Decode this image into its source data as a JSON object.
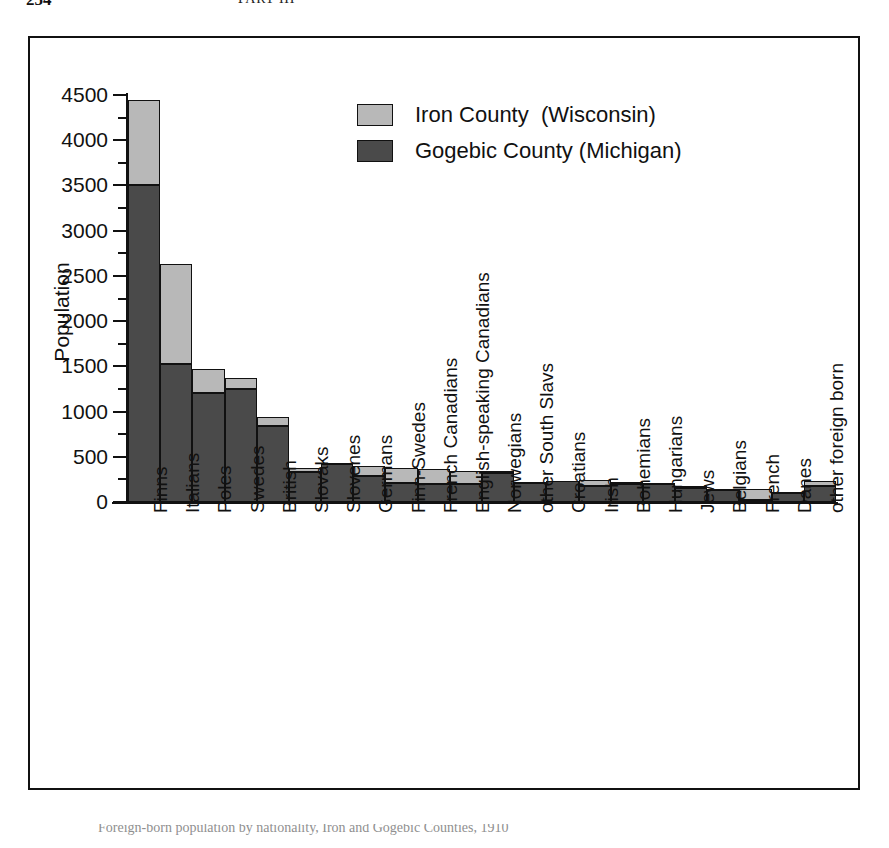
{
  "page": {
    "folio": "254",
    "running_head": "PART III"
  },
  "figure": {
    "caption": "Foreign-born population by nationality, Iron and Gogebic Counties, 1910"
  },
  "legend": {
    "position": "upper-center",
    "items": [
      {
        "label": "Iron County  (Wisconsin)",
        "color": "#b8b8b8",
        "name": "iron-county"
      },
      {
        "label": "Gogebic County (Michigan)",
        "color": "#4a4a4a",
        "name": "gogebic-county"
      }
    ]
  },
  "axes": {
    "y_title": "Population",
    "y_ticks": [
      "0",
      "500",
      "1000",
      "1500",
      "2000",
      "2500",
      "3000",
      "3500",
      "4000",
      "4500"
    ],
    "y_minor_step": 250
  },
  "chart_data": {
    "type": "bar",
    "stacked": true,
    "title": "",
    "xlabel": "",
    "ylabel": "Population",
    "ylim": [
      0,
      4500
    ],
    "ytick_step": 500,
    "grid": false,
    "legend_position": "upper-center",
    "categories": [
      "Finns",
      "Italians",
      "Poles",
      "Swedes",
      "British",
      "Slovaks",
      "Slovenes",
      "Germans",
      "Finn-Swedes",
      "French Canadians",
      "English-speaking Canadians",
      "Norwegians",
      "other South Slavs",
      "Croatians",
      "Irish",
      "Bohemians",
      "Hungarians",
      "Jews",
      "Belgians",
      "French",
      "Danes",
      "other foreign born"
    ],
    "series": [
      {
        "name": "Gogebic County (Michigan)",
        "color": "#4a4a4a",
        "values": [
          3500,
          1530,
          1200,
          1250,
          840,
          330,
          420,
          290,
          210,
          200,
          200,
          320,
          205,
          230,
          175,
          200,
          195,
          150,
          135,
          20,
          100,
          175
        ]
      },
      {
        "name": "Iron County  (Wisconsin)",
        "color": "#b8b8b8",
        "values": [
          940,
          1100,
          265,
          120,
          105,
          50,
          10,
          105,
          165,
          170,
          145,
          20,
          20,
          0,
          70,
          25,
          20,
          25,
          10,
          125,
          15,
          55
        ]
      }
    ],
    "totals": [
      4440,
      2630,
      1465,
      1370,
      945,
      380,
      430,
      395,
      375,
      370,
      345,
      340,
      225,
      230,
      245,
      225,
      215,
      175,
      145,
      145,
      115,
      230
    ]
  }
}
